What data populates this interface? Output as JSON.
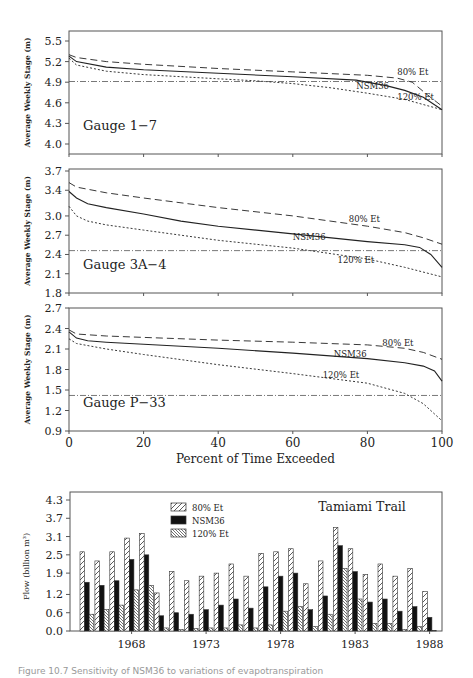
{
  "figure": {
    "caption": "Figure 10.7  Sensitivity of NSM36 to variations of evapotranspiration"
  },
  "chart_data": [
    {
      "type": "line",
      "title": "Gauge 1-7",
      "panel_label": "Gauge 1−7",
      "xlabel": "Percent of Time Exceeded",
      "ylabel": "Average Weekly Stage (m)",
      "xlim": [
        0,
        100
      ],
      "ylim": [
        3.85,
        5.6
      ],
      "yticks": [
        5.5,
        5.2,
        4.9,
        4.6,
        4.3,
        4.0
      ],
      "xticks": [
        0,
        20,
        40,
        60,
        80,
        100
      ],
      "reference_line": 4.91,
      "grid": false,
      "series": [
        {
          "name": "80% Et",
          "style": "dashed",
          "x": [
            0,
            2,
            10,
            20,
            40,
            60,
            80,
            88,
            92,
            96,
            100
          ],
          "y": [
            5.3,
            5.26,
            5.2,
            5.16,
            5.1,
            5.05,
            5.0,
            4.96,
            4.9,
            4.72,
            4.55
          ]
        },
        {
          "name": "NSM36",
          "style": "solid",
          "x": [
            0,
            2,
            10,
            20,
            40,
            60,
            77,
            85,
            90,
            95,
            100
          ],
          "y": [
            5.28,
            5.2,
            5.12,
            5.08,
            5.03,
            4.98,
            4.93,
            4.85,
            4.78,
            4.68,
            4.5
          ]
        },
        {
          "name": "120% Et",
          "style": "dotted",
          "x": [
            0,
            2,
            10,
            20,
            30,
            40,
            50,
            60,
            70,
            80,
            90,
            100
          ],
          "y": [
            5.25,
            5.15,
            5.06,
            5.01,
            4.98,
            4.95,
            4.92,
            4.88,
            4.82,
            4.74,
            4.65,
            4.5
          ]
        }
      ],
      "annotations": [
        {
          "text": "80% Et",
          "x": 88,
          "y": 5.0
        },
        {
          "text": "NSM36",
          "x": 77,
          "y": 4.8
        },
        {
          "text": "120% Et",
          "x": 88,
          "y": 4.64
        }
      ]
    },
    {
      "type": "line",
      "title": "Gauge 3A-4",
      "panel_label": "Gauge 3A−4",
      "xlabel": "Percent of Time Exceeded",
      "ylabel": "Average Weekly Stage (m)",
      "xlim": [
        0,
        100
      ],
      "ylim": [
        1.8,
        3.7
      ],
      "yticks": [
        3.7,
        3.4,
        3.0,
        2.7,
        2.4,
        2.1,
        1.8
      ],
      "xticks": [
        0,
        20,
        40,
        60,
        80,
        100
      ],
      "reference_line": 2.46,
      "grid": false,
      "series": [
        {
          "name": "80% Et",
          "style": "dashed",
          "x": [
            0,
            2,
            10,
            20,
            40,
            60,
            80,
            90,
            95,
            100
          ],
          "y": [
            3.52,
            3.45,
            3.36,
            3.28,
            3.13,
            3.0,
            2.84,
            2.74,
            2.66,
            2.56
          ]
        },
        {
          "name": "NSM36",
          "style": "solid",
          "x": [
            0,
            2,
            5,
            10,
            20,
            30,
            40,
            60,
            80,
            90,
            94,
            97,
            100
          ],
          "y": [
            3.38,
            3.28,
            3.19,
            3.13,
            3.03,
            2.92,
            2.84,
            2.72,
            2.6,
            2.55,
            2.51,
            2.4,
            2.2
          ]
        },
        {
          "name": "120% Et",
          "style": "dotted",
          "x": [
            0,
            2,
            5,
            10,
            20,
            40,
            60,
            80,
            90,
            100
          ],
          "y": [
            3.15,
            3.0,
            2.92,
            2.86,
            2.78,
            2.62,
            2.5,
            2.33,
            2.2,
            2.05
          ]
        }
      ],
      "annotations": [
        {
          "text": "80% Et",
          "x": 75,
          "y": 2.9
        },
        {
          "text": "NSM36",
          "x": 60,
          "y": 2.62
        },
        {
          "text": "120% Et",
          "x": 72,
          "y": 2.26
        }
      ]
    },
    {
      "type": "line",
      "title": "Gauge P-33",
      "panel_label": "Gauge P−33",
      "xlabel": "Percent of Time Exceeded",
      "ylabel": "Average Weekly Stage (m)",
      "xlim": [
        0,
        100
      ],
      "ylim": [
        0.9,
        2.7
      ],
      "yticks": [
        2.7,
        2.4,
        2.1,
        1.8,
        1.5,
        1.2,
        0.9
      ],
      "xticks": [
        0,
        20,
        40,
        60,
        80,
        100
      ],
      "reference_line": 1.42,
      "grid": false,
      "series": [
        {
          "name": "80% Et",
          "style": "dashed",
          "x": [
            0,
            2,
            10,
            20,
            40,
            60,
            80,
            90,
            95,
            100
          ],
          "y": [
            2.38,
            2.32,
            2.29,
            2.27,
            2.23,
            2.2,
            2.16,
            2.11,
            2.05,
            1.95
          ]
        },
        {
          "name": "NSM36",
          "style": "solid",
          "x": [
            0,
            2,
            5,
            10,
            20,
            40,
            60,
            80,
            90,
            95,
            98,
            100
          ],
          "y": [
            2.35,
            2.26,
            2.22,
            2.2,
            2.17,
            2.11,
            2.04,
            1.96,
            1.9,
            1.85,
            1.78,
            1.63
          ]
        },
        {
          "name": "120% Et",
          "style": "dotted",
          "x": [
            0,
            2,
            10,
            20,
            40,
            60,
            80,
            90,
            95,
            100
          ],
          "y": [
            2.25,
            2.18,
            2.1,
            2.02,
            1.87,
            1.74,
            1.6,
            1.45,
            1.3,
            1.05
          ]
        }
      ],
      "annotations": [
        {
          "text": "80% Et",
          "x": 84,
          "y": 2.14
        },
        {
          "text": "NSM36",
          "x": 71,
          "y": 1.98
        },
        {
          "text": "120% Et",
          "x": 68,
          "y": 1.68
        }
      ]
    },
    {
      "type": "bar",
      "title": "Tamiami Trail",
      "xlabel": "",
      "ylabel": "Flow (billion m³)",
      "ylim": [
        0,
        4.3
      ],
      "yticks": [
        0.0,
        0.6,
        1.2,
        1.9,
        2.5,
        3.1,
        3.7,
        4.3
      ],
      "xtick_labels": [
        "1968",
        "1973",
        "1978",
        "1983",
        "1988"
      ],
      "categories": [
        "1965",
        "1966",
        "1967",
        "1968",
        "1969",
        "1970",
        "1971",
        "1972",
        "1973",
        "1974",
        "1975",
        "1976",
        "1977",
        "1978",
        "1979",
        "1980",
        "1981",
        "1982",
        "1983",
        "1984",
        "1985",
        "1986",
        "1987",
        "1988"
      ],
      "legend_position": "upper center",
      "series": [
        {
          "name": "80% Et",
          "pattern": "hatch-forward",
          "values": [
            2.6,
            2.3,
            2.6,
            3.05,
            3.2,
            1.25,
            1.95,
            1.65,
            1.8,
            1.9,
            2.2,
            1.8,
            2.55,
            2.6,
            2.7,
            1.55,
            2.3,
            3.4,
            2.7,
            1.85,
            2.2,
            1.8,
            2.05,
            1.3
          ]
        },
        {
          "name": "NSM36",
          "pattern": "solid-black",
          "values": [
            1.6,
            1.5,
            1.65,
            2.35,
            2.5,
            0.5,
            0.6,
            0.55,
            0.7,
            0.85,
            1.05,
            0.75,
            1.45,
            1.8,
            1.9,
            0.7,
            1.15,
            2.8,
            1.95,
            0.95,
            1.05,
            0.65,
            0.8,
            0.45
          ]
        },
        {
          "name": "120% Et",
          "pattern": "hatch-back",
          "values": [
            0.55,
            0.7,
            0.85,
            1.35,
            1.5,
            0.1,
            0.05,
            0.08,
            0.1,
            0.1,
            0.2,
            0.1,
            0.2,
            0.65,
            0.8,
            0.15,
            0.55,
            2.05,
            1.05,
            0.25,
            0.25,
            0.05,
            0.15,
            0.02
          ]
        }
      ]
    }
  ]
}
